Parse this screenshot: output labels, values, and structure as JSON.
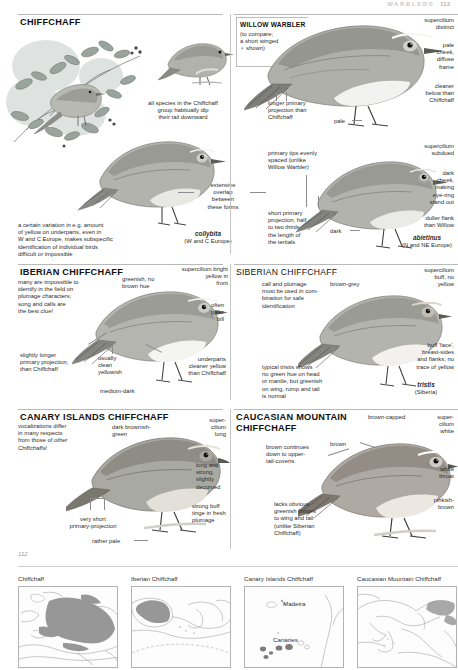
{
  "runhead": {
    "title": "WARBLERS",
    "page": "113"
  },
  "page_number": "112",
  "sections": {
    "chiffchaff": {
      "title": "CHIFFCHAFF",
      "notes": {
        "tail_dip": "all species in the Chiffchaff\ngroup habitually dip\ntheir tail downward",
        "variation": "a certain variation in e.g. amount\nof yellow on underparts, even in\nW and C Europe, makes subspecific\nidentification of individual birds\ndifficult or impossible",
        "overlap": "extensive\noverlap\nbetween\nthese forms",
        "primary_tips": "primary tips evenly\nspaced (unlike\nWillow Warbler)",
        "short_primary": "short primary\nprojection, half\nto two thirds\nthe length of\nthe tertials",
        "dark": "dark",
        "supercilium_subdued": "supercilium\nsubdued",
        "dark_cheek": "dark\ncheek,\nmaking\neye-ring\nstand out",
        "duller_flank": "duller flank\nthan Willow"
      },
      "races": [
        {
          "name": "collybita",
          "range": "(W and C Europe)"
        },
        {
          "name": "abietinus",
          "range": "(N and NE Europe)"
        }
      ]
    },
    "willow_warbler": {
      "title": "WILLOW WARBLER",
      "subtitle": "(to compare;\na short winged\n♀ shown)",
      "notes": {
        "supercilium": "supercilium\ndistinct",
        "pale_cheek": "pale\ncheek,\ndiffuse\nframe",
        "cleaner_below": "cleaner\nbelow than\nChiffchaff",
        "longer_primary": "longer primary\nprojection than\nChiffchaff",
        "pale": "pale"
      }
    },
    "iberian": {
      "title": "IBERIAN CHIFFCHAFF",
      "notes": {
        "intro": "many are impossible to\nidentify in the field on\nplumage characters;\nsong and calls are\nthe best clue!",
        "greenish": "greenish, no\nbrown hue",
        "supercilium": "supercilium bright\nyellow in\nfront",
        "paler_bill": "often\npaler\nbill",
        "underparts": "underparts\ncleaner yellow\nthan Chiffchaff",
        "longer_primary": "slightly longer\nprimary projection,\nthan Chiffchaff",
        "clean_yellowish": "usually\nclean\nyellowish",
        "medium_dark": "medium-dark"
      }
    },
    "siberian": {
      "title": "SIBERIAN CHIFFCHAFF",
      "notes": {
        "intro": "call and plumage\nmust be used in com-\nbination for safe\nidentification",
        "brown_grey": "brown-grey",
        "supercilium": "supercilium\nbuff, no\nyellow",
        "buff_face": "buff 'face',\nbreast-sides\nand flanks; no\ntrace of yellow",
        "tristis_note": "typical tristis shows\nno green hue on head\nor mantle, but greenish\non wing, rump and tail\nis normal"
      },
      "race": {
        "name": "tristis",
        "range": "(Siberia)"
      }
    },
    "canary": {
      "title": "CANARY ISLANDS CHIFFCHAFF",
      "notes": {
        "intro": "vocalizations differ\nin many respects\nfrom those of other\nChiffchaffs!",
        "dark_green": "dark brownish-\ngreen",
        "supercilium": "super-\ncilium\nlong",
        "bill": "long and\nstrong,\nslightly\ndecurved",
        "buff_tinge": "strong buff\ntinge in fresh\nplumage",
        "short_primary": "very short\nprimary-projection",
        "rather_pale": "rather pale"
      }
    },
    "caucasian": {
      "title": "CAUCASIAN MOUNTAIN\nCHIFFCHAFF",
      "notes": {
        "brown_continues": "brown continues\ndown to upper-\ntail-coverts",
        "brown": "brown",
        "brown_capped": "brown-capped",
        "supercilium": "super-\ncilium\nwhite",
        "white_throat": "white\nthroat",
        "pinkish_brown": "pinkish-\nbrown",
        "lacks_fringes": "lacks obvious\ngreenish fringes\nto wing and tail\n(unlike Siberian\nChiffchaff)"
      }
    }
  },
  "maps": [
    {
      "title": "Chiffchaff",
      "labels": []
    },
    {
      "title": "Iberian Chiffchaff",
      "labels": []
    },
    {
      "title": "Canary Islands Chiffchaff",
      "labels": [
        "Madeira",
        "Canaries"
      ]
    },
    {
      "title": "Caucasian Mountain Chiffchaff",
      "labels": []
    }
  ],
  "colors": {
    "range_fill": "#8a8a8a",
    "rule": "#b9b9b9",
    "text": "#2c2c2c"
  }
}
